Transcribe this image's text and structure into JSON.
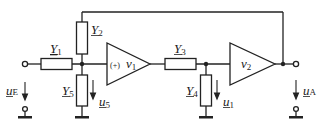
{
  "diagram": {
    "type": "circuit",
    "components": {
      "Y1": {
        "symbol": "Y",
        "subscript": "1"
      },
      "Y2": {
        "symbol": "Y",
        "subscript": "2"
      },
      "Y3": {
        "symbol": "Y",
        "subscript": "3"
      },
      "Y4": {
        "symbol": "Y",
        "subscript": "4"
      },
      "Y5": {
        "symbol": "Y",
        "subscript": "5"
      }
    },
    "amplifiers": {
      "amp1": {
        "sign": "(+)",
        "symbol": "v",
        "subscript": "1"
      },
      "amp2": {
        "symbol": "v",
        "subscript": "2"
      }
    },
    "voltages": {
      "uE": {
        "symbol": "u",
        "subscript": "E"
      },
      "u5": {
        "symbol": "u",
        "subscript": "5"
      },
      "u1": {
        "symbol": "u",
        "subscript": "1"
      },
      "uA": {
        "symbol": "u",
        "subscript": "A"
      }
    }
  }
}
